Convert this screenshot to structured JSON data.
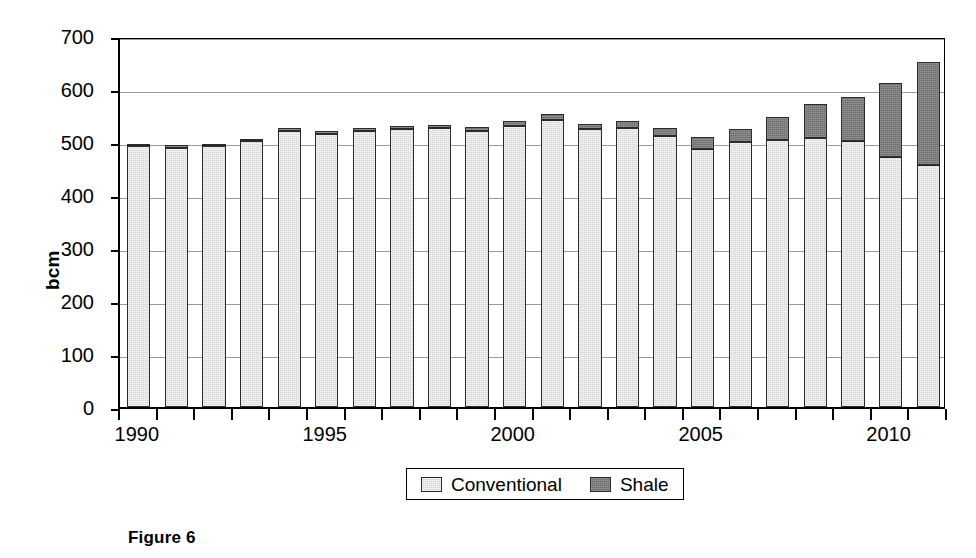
{
  "figure": {
    "caption": "Figure 6"
  },
  "chart_data": {
    "type": "bar",
    "stacked": true,
    "title": "",
    "xlabel": "",
    "ylabel": "bcm",
    "ylim": [
      0,
      700
    ],
    "ytick_step": 100,
    "yticks": [
      "0",
      "100",
      "200",
      "300",
      "400",
      "500",
      "600",
      "700"
    ],
    "grid": true,
    "grid_axis": "y",
    "legend_position": "bottom",
    "categories": [
      "1990",
      "1991",
      "1992",
      "1993",
      "1994",
      "1995",
      "1996",
      "1997",
      "1998",
      "1999",
      "2000",
      "2001",
      "2002",
      "2003",
      "2004",
      "2005",
      "2006",
      "2007",
      "2008",
      "2009",
      "2010",
      "2011"
    ],
    "xtick_labels": [
      "1990",
      "1995",
      "2000",
      "2005",
      "2010"
    ],
    "xtick_indices": [
      0,
      5,
      10,
      15,
      20
    ],
    "series": [
      {
        "name": "Conventional",
        "color": "#d4d4d4",
        "values": [
          492,
          489,
          492,
          501,
          521,
          515,
          521,
          524,
          526,
          520,
          530,
          542,
          524,
          527,
          511,
          487,
          500,
          503,
          508,
          502,
          471,
          456
        ]
      },
      {
        "name": "Shale",
        "color": "#6e6e6e",
        "values": [
          5,
          5,
          5,
          5,
          6,
          6,
          6,
          7,
          7,
          8,
          9,
          10,
          10,
          12,
          15,
          22,
          24,
          44,
          64,
          83,
          141,
          195
        ]
      }
    ],
    "totals": [
      497,
      494,
      497,
      506,
      527,
      521,
      527,
      531,
      533,
      528,
      539,
      552,
      534,
      539,
      526,
      509,
      524,
      547,
      572,
      585,
      612,
      651
    ]
  },
  "legend": {
    "items": [
      {
        "label": "Conventional",
        "swatch": "conventional-swatch"
      },
      {
        "label": "Shale",
        "swatch": "shale-swatch"
      }
    ]
  }
}
